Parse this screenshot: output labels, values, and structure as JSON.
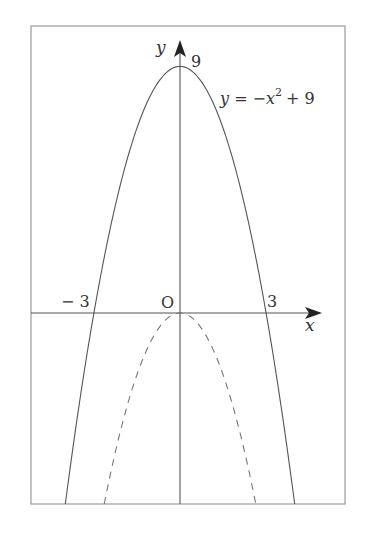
{
  "figure": {
    "frame": {
      "left": 31,
      "top": 26,
      "right": 345,
      "bottom": 504,
      "color": "#999999"
    },
    "origin_px": {
      "x": 180,
      "y": 313
    },
    "scale_px_per_unit": {
      "x": 28.7,
      "y": 27.4
    },
    "axis_color": "#555555",
    "curve_color": "#555555",
    "labels": {
      "y_axis": "y",
      "x_axis": "x",
      "origin": "O",
      "y_intercept": "9",
      "x_neg": "− 3",
      "x_pos": "3",
      "equation_lhs": "y = −x",
      "equation_exp": "2",
      "equation_rhs": "+ 9"
    }
  },
  "chart_data": {
    "type": "line",
    "title": "",
    "xlabel": "x",
    "ylabel": "y",
    "series": [
      {
        "name": "y = -x^2 + 9",
        "style": "solid",
        "function": "-x^2+9",
        "key_points": [
          [
            -3,
            0
          ],
          [
            0,
            9
          ],
          [
            3,
            0
          ]
        ]
      },
      {
        "name": "y = -x^2",
        "style": "dashed",
        "function": "-x^2",
        "key_points": [
          [
            0,
            0
          ]
        ]
      }
    ],
    "annotations": [
      "O",
      "9",
      "-3",
      "3",
      "y = -x^2 + 9"
    ],
    "xlim": [
      -5.1,
      5.7
    ],
    "ylim": [
      -7,
      10
    ],
    "grid": false
  }
}
